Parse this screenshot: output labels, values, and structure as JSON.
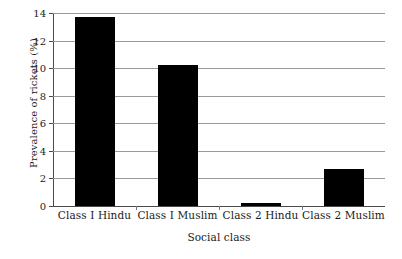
{
  "chart_data": {
    "type": "bar",
    "title": "",
    "xlabel": "Social class",
    "ylabel": "Prevalence of rickets (%)",
    "categories": [
      "Class I Hindu",
      "Class I Muslim",
      "Class 2 Hindu",
      "Class 2 Muslim"
    ],
    "values": [
      13.7,
      10.2,
      0.25,
      2.7
    ],
    "ylim": [
      0,
      14
    ],
    "ytick_labels": [
      "0",
      "2",
      "4",
      "6",
      "8",
      "10",
      "12",
      "14"
    ],
    "ytick_values": [
      0,
      2,
      4,
      6,
      8,
      10,
      12,
      14
    ],
    "grid": true,
    "legend": "none",
    "bar_color": "#000000",
    "grid_color": "#9a9a9a",
    "axis_color": "#4a4a4a",
    "background": "#ffffff"
  }
}
